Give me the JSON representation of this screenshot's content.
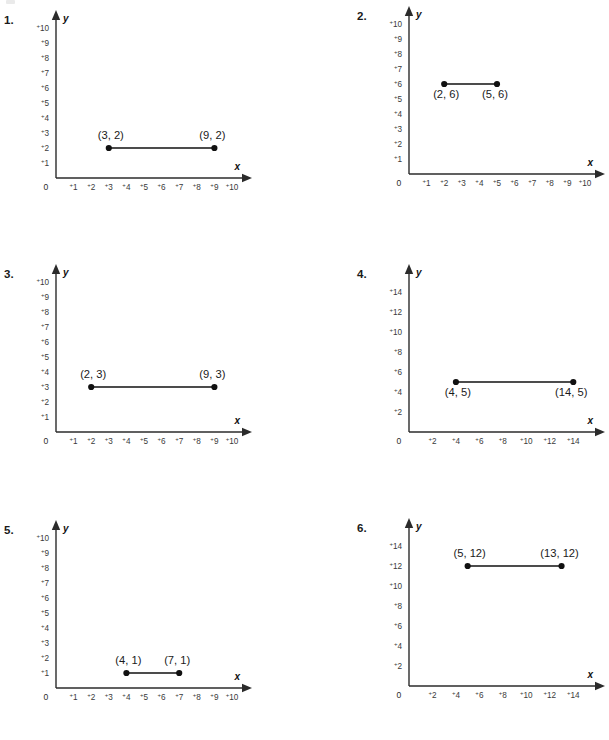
{
  "page": {
    "background_color": "#ffffff",
    "ink_color": "#1a1a1a"
  },
  "problems": [
    {
      "number": "1.",
      "x_axis_label": "x",
      "y_axis_label": "y",
      "origin_label": "0",
      "x_ticks": [
        "1",
        "2",
        "3",
        "4",
        "5",
        "6",
        "7",
        "8",
        "9",
        "10"
      ],
      "y_ticks": [
        "1",
        "2",
        "3",
        "4",
        "5",
        "6",
        "7",
        "8",
        "9",
        "10"
      ],
      "tick_sign": "+",
      "point_a_label": "(3, 2)",
      "point_b_label": "(9, 2)",
      "label_position": "above"
    },
    {
      "number": "2.",
      "x_axis_label": "x",
      "y_axis_label": "y",
      "origin_label": "0",
      "x_ticks": [
        "1",
        "2",
        "3",
        "4",
        "5",
        "6",
        "7",
        "8",
        "9",
        "10"
      ],
      "y_ticks": [
        "1",
        "2",
        "3",
        "4",
        "5",
        "6",
        "7",
        "8",
        "9",
        "10"
      ],
      "tick_sign": "+",
      "point_a_label": "(2, 6)",
      "point_b_label": "(5, 6)",
      "label_position": "below"
    },
    {
      "number": "3.",
      "x_axis_label": "x",
      "y_axis_label": "y",
      "origin_label": "0",
      "x_ticks": [
        "1",
        "2",
        "3",
        "4",
        "5",
        "6",
        "7",
        "8",
        "9",
        "10"
      ],
      "y_ticks": [
        "1",
        "2",
        "3",
        "4",
        "5",
        "6",
        "7",
        "8",
        "9",
        "10"
      ],
      "tick_sign": "+",
      "point_a_label": "(2, 3)",
      "point_b_label": "(9, 3)",
      "label_position": "above"
    },
    {
      "number": "4.",
      "x_axis_label": "x",
      "y_axis_label": "y",
      "origin_label": "0",
      "x_ticks": [
        "2",
        "4",
        "6",
        "8",
        "10",
        "12",
        "14"
      ],
      "y_ticks": [
        "2",
        "4",
        "6",
        "8",
        "10",
        "12",
        "14"
      ],
      "tick_sign": "+",
      "point_a_label": "(4, 5)",
      "point_b_label": "(14, 5)",
      "label_position": "below"
    },
    {
      "number": "5.",
      "x_axis_label": "x",
      "y_axis_label": "y",
      "origin_label": "0",
      "x_ticks": [
        "1",
        "2",
        "3",
        "4",
        "5",
        "6",
        "7",
        "8",
        "9",
        "10"
      ],
      "y_ticks": [
        "1",
        "2",
        "3",
        "4",
        "5",
        "6",
        "7",
        "8",
        "9",
        "10"
      ],
      "tick_sign": "+",
      "point_a_label": "(4, 1)",
      "point_b_label": "(7, 1)",
      "label_position": "above"
    },
    {
      "number": "6.",
      "x_axis_label": "x",
      "y_axis_label": "y",
      "origin_label": "0",
      "x_ticks": [
        "2",
        "4",
        "6",
        "8",
        "10",
        "12",
        "14"
      ],
      "y_ticks": [
        "2",
        "4",
        "6",
        "8",
        "10",
        "12",
        "14"
      ],
      "tick_sign": "+",
      "point_a_label": "(5, 12)",
      "point_b_label": "(13, 12)",
      "label_position": "above"
    }
  ],
  "chart_data": [
    {
      "type": "scatter",
      "title": "1.",
      "xlabel": "x",
      "ylabel": "y",
      "xlim": [
        0,
        10
      ],
      "ylim": [
        0,
        10
      ],
      "xticks": [
        1,
        2,
        3,
        4,
        5,
        6,
        7,
        8,
        9,
        10
      ],
      "yticks": [
        1,
        2,
        3,
        4,
        5,
        6,
        7,
        8,
        9,
        10
      ],
      "grid": false,
      "series": [
        {
          "name": "segment",
          "points": [
            {
              "x": 3,
              "y": 2,
              "label": "(3, 2)"
            },
            {
              "x": 9,
              "y": 2,
              "label": "(9, 2)"
            }
          ],
          "connected": true
        }
      ]
    },
    {
      "type": "scatter",
      "title": "2.",
      "xlabel": "x",
      "ylabel": "y",
      "xlim": [
        0,
        10
      ],
      "ylim": [
        0,
        10
      ],
      "xticks": [
        1,
        2,
        3,
        4,
        5,
        6,
        7,
        8,
        9,
        10
      ],
      "yticks": [
        1,
        2,
        3,
        4,
        5,
        6,
        7,
        8,
        9,
        10
      ],
      "grid": false,
      "series": [
        {
          "name": "segment",
          "points": [
            {
              "x": 2,
              "y": 6,
              "label": "(2, 6)"
            },
            {
              "x": 5,
              "y": 6,
              "label": "(5, 6)"
            }
          ],
          "connected": true
        }
      ]
    },
    {
      "type": "scatter",
      "title": "3.",
      "xlabel": "x",
      "ylabel": "y",
      "xlim": [
        0,
        10
      ],
      "ylim": [
        0,
        10
      ],
      "xticks": [
        1,
        2,
        3,
        4,
        5,
        6,
        7,
        8,
        9,
        10
      ],
      "yticks": [
        1,
        2,
        3,
        4,
        5,
        6,
        7,
        8,
        9,
        10
      ],
      "grid": false,
      "series": [
        {
          "name": "segment",
          "points": [
            {
              "x": 2,
              "y": 3,
              "label": "(2, 3)"
            },
            {
              "x": 9,
              "y": 3,
              "label": "(9, 3)"
            }
          ],
          "connected": true
        }
      ]
    },
    {
      "type": "scatter",
      "title": "4.",
      "xlabel": "x",
      "ylabel": "y",
      "xlim": [
        0,
        15
      ],
      "ylim": [
        0,
        15
      ],
      "xticks": [
        2,
        4,
        6,
        8,
        10,
        12,
        14
      ],
      "yticks": [
        2,
        4,
        6,
        8,
        10,
        12,
        14
      ],
      "grid": false,
      "series": [
        {
          "name": "segment",
          "points": [
            {
              "x": 4,
              "y": 5,
              "label": "(4, 5)"
            },
            {
              "x": 14,
              "y": 5,
              "label": "(14, 5)"
            }
          ],
          "connected": true
        }
      ]
    },
    {
      "type": "scatter",
      "title": "5.",
      "xlabel": "x",
      "ylabel": "y",
      "xlim": [
        0,
        10
      ],
      "ylim": [
        0,
        10
      ],
      "xticks": [
        1,
        2,
        3,
        4,
        5,
        6,
        7,
        8,
        9,
        10
      ],
      "yticks": [
        1,
        2,
        3,
        4,
        5,
        6,
        7,
        8,
        9,
        10
      ],
      "grid": false,
      "series": [
        {
          "name": "segment",
          "points": [
            {
              "x": 4,
              "y": 1,
              "label": "(4, 1)"
            },
            {
              "x": 7,
              "y": 1,
              "label": "(7, 1)"
            }
          ],
          "connected": true
        }
      ]
    },
    {
      "type": "scatter",
      "title": "6.",
      "xlabel": "x",
      "ylabel": "y",
      "xlim": [
        0,
        15
      ],
      "ylim": [
        0,
        15
      ],
      "xticks": [
        2,
        4,
        6,
        8,
        10,
        12,
        14
      ],
      "yticks": [
        2,
        4,
        6,
        8,
        10,
        12,
        14
      ],
      "grid": false,
      "series": [
        {
          "name": "segment",
          "points": [
            {
              "x": 5,
              "y": 12,
              "label": "(5, 12)"
            },
            {
              "x": 13,
              "y": 12,
              "label": "(13, 12)"
            }
          ],
          "connected": true
        }
      ]
    }
  ]
}
